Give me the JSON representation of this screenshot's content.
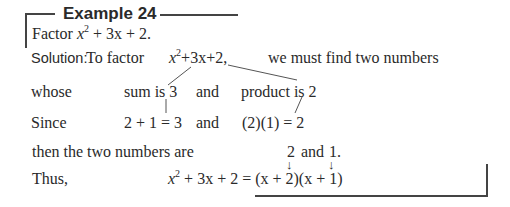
{
  "example": {
    "title": "Example 24",
    "problem_prefix": "Factor ",
    "problem_expr_x": "x",
    "problem_expr_exp": "2",
    "problem_expr_rest": " + 3x + 2."
  },
  "solution": {
    "label": "Solution:",
    "intro": "To factor",
    "expr_x": "x",
    "expr_exp": "2",
    "expr_rest": "+3x+2,",
    "intro_tail": "we must find two numbers"
  },
  "whose_line": {
    "lead": "whose",
    "sum": "sum is 3",
    "and": "and",
    "product": "product is 2"
  },
  "since_line": {
    "lead": "Since",
    "sum_eq": "2 + 1 = 3",
    "and": "and",
    "product_eq": "(2)(1) = 2"
  },
  "then_line": {
    "lead": "then the two numbers are",
    "first": "2",
    "and": "and",
    "second": "1."
  },
  "arrows": {
    "glyph": "↓"
  },
  "thus_line": {
    "lead": "Thus,",
    "lhs_x": "x",
    "lhs_exp": "2",
    "lhs_rest": " + 3x + 2 = ",
    "rhs": "(x + 2)(x + 1)"
  }
}
